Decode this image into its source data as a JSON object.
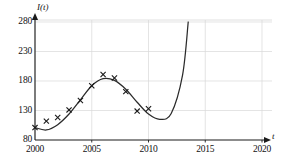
{
  "chart_data": {
    "type": "line",
    "title": "",
    "xlabel": "t",
    "ylabel": "I(t)",
    "xlim": [
      2000,
      2020
    ],
    "ylim": [
      80,
      280
    ],
    "grid": true,
    "legend": null,
    "xticks": [
      2000,
      2005,
      2010,
      2015,
      2020
    ],
    "xtick_labels": [
      "2000",
      "2005",
      "2010",
      "2015",
      "2020"
    ],
    "yticks": [
      80,
      130,
      180,
      230,
      280
    ],
    "ytick_labels": [
      "80",
      "130",
      "180",
      "230",
      "280"
    ],
    "series": [
      {
        "name": "data points",
        "type": "scatter",
        "marker": "x",
        "x": [
          2000,
          2001,
          2002,
          2003,
          2004,
          2005,
          2006,
          2007,
          2008,
          2009,
          2010
        ],
        "y": [
          101,
          112,
          118,
          131,
          147,
          172,
          191,
          185,
          162,
          129,
          133
        ]
      },
      {
        "name": "fitted curve",
        "type": "line",
        "x": [
          2000,
          2001,
          2002,
          2003,
          2004,
          2005,
          2006,
          2007,
          2008,
          2009,
          2010,
          2011,
          2012,
          2013,
          2013.5
        ],
        "y": [
          101,
          97,
          106,
          124,
          148,
          172,
          184,
          181,
          166,
          144,
          124,
          115,
          125,
          190,
          280
        ]
      }
    ],
    "annotations": {
      "curve_exits_top_at_x": 2013.5,
      "local_max": {
        "x": 2006.1,
        "y": 184
      },
      "local_min": {
        "x": 2011.2,
        "y": 115
      }
    }
  },
  "axes": {
    "y_axis_name": "I(t)",
    "x_axis_name": "t"
  },
  "colors": {
    "axis": "#1a1a1a",
    "grid": "#d8d8d8",
    "curve": "#2b2b2b",
    "marker": "#1a1a1a",
    "background": "#ffffff"
  }
}
